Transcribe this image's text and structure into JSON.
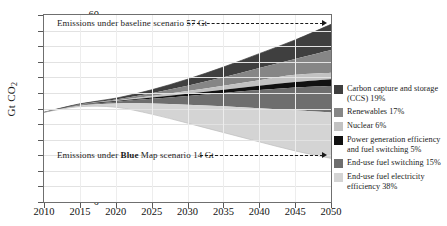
{
  "chart_data": {
    "type": "area",
    "title": "",
    "subtitle": "",
    "xlabel": "",
    "ylabel": "Gt CO2",
    "ylabel_display": "Gt CO",
    "ylabel_sub": "2",
    "xlim": [
      2010,
      2050
    ],
    "ylim": [
      0,
      60
    ],
    "grid": true,
    "legend_position": "right",
    "yticks": [
      0,
      5,
      10,
      15,
      20,
      25,
      30,
      35,
      40,
      45,
      50,
      55,
      60
    ],
    "xticks": [
      2010,
      2015,
      2020,
      2025,
      2030,
      2035,
      2040,
      2045,
      2050
    ],
    "x": [
      2010,
      2015,
      2020,
      2025,
      2030,
      2035,
      2040,
      2045,
      2050
    ],
    "baseline_emissions": [
      28.8,
      31.5,
      33.3,
      36.0,
      39.4,
      43.3,
      47.6,
      52.0,
      57.0
    ],
    "blue_map_emissions": [
      28.8,
      30.6,
      30.4,
      28.2,
      25.3,
      22.3,
      19.3,
      16.4,
      14.0
    ],
    "series": [
      {
        "name": "Carbon capture and storage (CCS) 19%",
        "short": "CCS",
        "share_pct": 19,
        "color": "#3f3f3f",
        "values_top": [
          28.8,
          31.5,
          33.3,
          36.0,
          39.4,
          43.3,
          47.6,
          52.0,
          57.0
        ],
        "values_bottom": [
          28.8,
          31.4,
          32.9,
          34.9,
          37.3,
          40.0,
          43.0,
          45.9,
          48.8
        ]
      },
      {
        "name": "Renewables 17%",
        "short": "Renewables",
        "share_pct": 17,
        "color": "#868686",
        "values_top": [
          28.8,
          31.4,
          32.9,
          34.9,
          37.3,
          40.0,
          43.0,
          45.9,
          48.8
        ],
        "values_bottom": [
          28.8,
          31.3,
          32.6,
          34.0,
          35.6,
          37.3,
          39.1,
          40.8,
          41.5
        ]
      },
      {
        "name": "Nuclear 6%",
        "short": "Nuclear",
        "share_pct": 6,
        "color": "#c2c2c2",
        "values_top": [
          28.8,
          31.3,
          32.6,
          34.0,
          35.6,
          37.3,
          39.1,
          40.8,
          41.5
        ],
        "values_bottom": [
          28.8,
          31.2,
          32.4,
          33.5,
          34.7,
          36.0,
          37.3,
          38.5,
          39.4
        ]
      },
      {
        "name": "Power generation efficiency and fuel switching 5%",
        "short": "Power generation efficiency and fuel switching",
        "share_pct": 5,
        "color": "#111111",
        "values_top": [
          28.8,
          31.2,
          32.4,
          33.5,
          34.7,
          36.0,
          37.3,
          38.5,
          39.4
        ],
        "values_bottom": [
          28.8,
          31.1,
          32.2,
          33.1,
          34.0,
          35.0,
          35.9,
          36.7,
          37.2
        ]
      },
      {
        "name": "End-use fuel switching 15%",
        "short": "End-use fuel switching",
        "share_pct": 15,
        "color": "#6e6e6e",
        "values_top": [
          28.8,
          31.1,
          32.2,
          33.1,
          34.0,
          35.0,
          35.9,
          36.7,
          37.2
        ],
        "values_bottom": [
          28.8,
          30.9,
          31.6,
          31.6,
          31.2,
          30.7,
          30.1,
          29.4,
          28.7
        ]
      },
      {
        "name": "End-use fuel electricity efficiency 38%",
        "short": "End-use fuel electricity efficiency",
        "share_pct": 38,
        "color": "#d4d4d4",
        "values_top": [
          28.8,
          30.9,
          31.6,
          31.6,
          31.2,
          30.7,
          30.1,
          29.4,
          28.7
        ],
        "values_bottom": [
          28.8,
          30.6,
          30.4,
          28.2,
          25.3,
          22.3,
          19.3,
          16.4,
          14.0
        ]
      }
    ],
    "annotations": [
      {
        "id": "baseline",
        "text_prefix": "Emissions under baseline scenario 57 Gt",
        "bold_word": "",
        "text_suffix": "",
        "value": 57,
        "unit": "Gt"
      },
      {
        "id": "blue-map",
        "text_prefix": "Emissions under ",
        "bold_word": "Blue",
        "text_suffix": " Map scenario 14 Gt",
        "value": 14,
        "unit": "Gt"
      }
    ],
    "legend_entries": [
      {
        "label": "Carbon capture and storage (CCS) 19%",
        "color": "#3f3f3f"
      },
      {
        "label": "Renewables 17%",
        "color": "#868686"
      },
      {
        "label": "Nuclear 6%",
        "color": "#c2c2c2"
      },
      {
        "label": "Power generation efficiency and fuel switching 5%",
        "color": "#111111"
      },
      {
        "label": "End-use fuel switching 15%",
        "color": "#6e6e6e"
      },
      {
        "label": "End-use fuel electricity efficiency 38%",
        "color": "#d4d4d4"
      }
    ]
  }
}
